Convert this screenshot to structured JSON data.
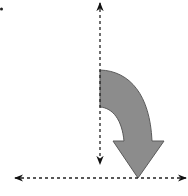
{
  "diagram": {
    "title": "",
    "colors": {
      "background": "#ffffff",
      "axis_line": "#222222",
      "curved_arrow_fill": "#8c8c8c",
      "curved_arrow_stroke": "#5a5a5a"
    },
    "elements": [
      {
        "type": "dot",
        "position": [
          1,
          9
        ]
      },
      {
        "type": "dashed-double-arrow",
        "orientation": "vertical",
        "from": [
          100,
          2
        ],
        "to": [
          100,
          165
        ]
      },
      {
        "type": "dashed-double-arrow",
        "orientation": "horizontal",
        "from": [
          14,
          178
        ],
        "to": [
          187,
          178
        ]
      },
      {
        "type": "curved-block-arrow",
        "direction": "clockwise-down",
        "start_x": 100,
        "outer_top_y": 70,
        "inner_top_y": 107,
        "tip": [
          138,
          178
        ]
      }
    ]
  }
}
